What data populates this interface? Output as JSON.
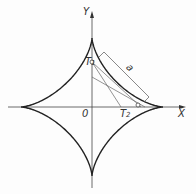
{
  "diagram": {
    "type": "astroid",
    "axes": {
      "x_label": "X",
      "y_label": "Y",
      "origin_label": "0"
    },
    "points": [
      {
        "label": "T",
        "subscript": "1"
      },
      {
        "label": "T",
        "subscript": "2"
      }
    ],
    "segment_label": "a",
    "colors": {
      "curve": "#222222",
      "axis": "#444444",
      "line": "#666666"
    }
  }
}
